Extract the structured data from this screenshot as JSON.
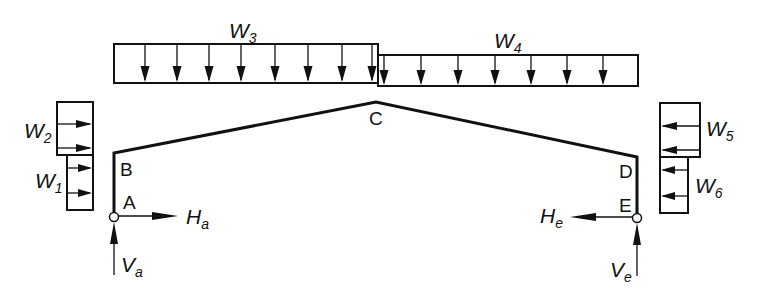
{
  "diagram": {
    "type": "portal-frame-loading",
    "nodes": {
      "A": "A",
      "B": "B",
      "C": "C",
      "D": "D",
      "E": "E"
    },
    "loads": {
      "W1": {
        "main": "W",
        "sub": "1",
        "direction": "right",
        "position": "left column lower"
      },
      "W2": {
        "main": "W",
        "sub": "2",
        "direction": "right",
        "position": "left column upper"
      },
      "W3": {
        "main": "W",
        "sub": "3",
        "direction": "down",
        "position": "left rafter"
      },
      "W4": {
        "main": "W",
        "sub": "4",
        "direction": "down",
        "position": "right rafter"
      },
      "W5": {
        "main": "W",
        "sub": "5",
        "direction": "left",
        "position": "right column upper"
      },
      "W6": {
        "main": "W",
        "sub": "6",
        "direction": "left",
        "position": "right column lower"
      }
    },
    "reactions": {
      "Ha": {
        "main": "H",
        "sub": "a",
        "direction": "right"
      },
      "Va": {
        "main": "V",
        "sub": "a",
        "direction": "up"
      },
      "He": {
        "main": "H",
        "sub": "e",
        "direction": "left"
      },
      "Ve": {
        "main": "V",
        "sub": "e",
        "direction": "up"
      }
    },
    "colors": {
      "line": "#111111",
      "background": "#ffffff"
    }
  }
}
